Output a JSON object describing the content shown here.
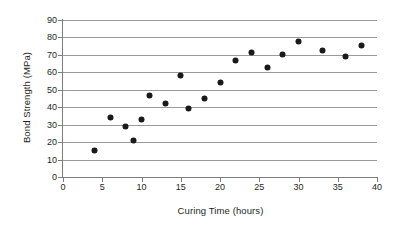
{
  "chart_data": {
    "type": "scatter",
    "title": "",
    "xlabel": "Curing Time (hours)",
    "ylabel": "Bond Strength (MPa)",
    "xlim": [
      0,
      40
    ],
    "ylim": [
      0,
      90
    ],
    "xticks": [
      0,
      5,
      10,
      15,
      20,
      25,
      30,
      35,
      40
    ],
    "yticks": [
      0,
      10,
      20,
      30,
      40,
      50,
      60,
      70,
      80,
      90
    ],
    "grid": "horizontal",
    "legend": "none",
    "marker": "filled-circle",
    "marker_color": "#1a1a1a",
    "x": [
      4,
      6,
      8,
      9,
      10,
      11,
      13,
      15,
      16,
      18,
      20,
      22,
      24,
      26,
      28,
      30,
      33,
      36,
      38
    ],
    "y": [
      15,
      34,
      29,
      21,
      33,
      47,
      42,
      58,
      39,
      45,
      54,
      66.5,
      71.5,
      62.5,
      70,
      77.5,
      72.5,
      69,
      75.5
    ],
    "points": [
      {
        "x": 4,
        "y": 15
      },
      {
        "x": 6,
        "y": 34
      },
      {
        "x": 8,
        "y": 29
      },
      {
        "x": 9,
        "y": 21
      },
      {
        "x": 10,
        "y": 33
      },
      {
        "x": 11,
        "y": 47
      },
      {
        "x": 13,
        "y": 42
      },
      {
        "x": 15,
        "y": 58
      },
      {
        "x": 16,
        "y": 39
      },
      {
        "x": 18,
        "y": 45
      },
      {
        "x": 20,
        "y": 54
      },
      {
        "x": 22,
        "y": 66.5
      },
      {
        "x": 24,
        "y": 71.5
      },
      {
        "x": 26,
        "y": 62.5
      },
      {
        "x": 28,
        "y": 70
      },
      {
        "x": 30,
        "y": 77.5
      },
      {
        "x": 33,
        "y": 72.5
      },
      {
        "x": 36,
        "y": 69
      },
      {
        "x": 38,
        "y": 75.5
      }
    ]
  },
  "axes": {
    "x_title": "Curing Time (hours)",
    "y_title": "Bond Strength (MPa)",
    "x_tick_labels": [
      "0",
      "5",
      "10",
      "15",
      "20",
      "25",
      "30",
      "35",
      "40"
    ],
    "y_tick_labels": [
      "0",
      "10",
      "20",
      "30",
      "40",
      "50",
      "60",
      "70",
      "80",
      "90"
    ]
  },
  "colors": {
    "background": "#ffffff",
    "gridline": "#9a9a9a",
    "axis": "#7d7d7d",
    "marker": "#1a1a1a",
    "text": "#231f20"
  }
}
